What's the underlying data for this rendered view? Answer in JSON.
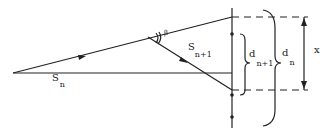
{
  "labels": {
    "s_n": {
      "main": "S",
      "sub": "n"
    },
    "s_n1": {
      "main": "S",
      "sub": "n+1"
    },
    "beta": "β",
    "d_n1": {
      "main": "d",
      "sub": "n+1"
    },
    "d_n": {
      "main": "d",
      "sub": "n"
    },
    "x": "x"
  },
  "colors": {
    "stroke": "#222222",
    "background": "#ffffff"
  }
}
